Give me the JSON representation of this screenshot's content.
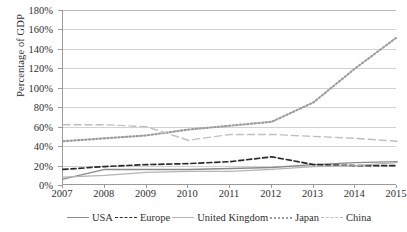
{
  "chart_data": {
    "type": "line",
    "title": "",
    "xlabel": "",
    "ylabel": "Percentage of GDP",
    "ylim": [
      0,
      180
    ],
    "ytick_step": 20,
    "grid": true,
    "legend_position": "bottom",
    "categories": [
      "2007",
      "2008",
      "2009",
      "2010",
      "2011",
      "2012",
      "2013",
      "2014",
      "2015"
    ],
    "x": [
      2007,
      2008,
      2009,
      2010,
      2011,
      2012,
      2013,
      2014,
      2015
    ],
    "ytick_labels": [
      "0%",
      "20%",
      "40%",
      "60%",
      "80%",
      "100%",
      "120%",
      "140%",
      "160%",
      "180%"
    ],
    "ytick_values": [
      0,
      20,
      40,
      60,
      80,
      100,
      120,
      140,
      160,
      180
    ],
    "series": [
      {
        "name": "USA",
        "values": [
          6,
          16,
          16,
          16,
          17,
          18,
          21,
          23,
          24
        ],
        "color": "#8a8a8a",
        "dash": "none",
        "width": 1.4
      },
      {
        "name": "Europe",
        "values": [
          16,
          19,
          21,
          22,
          24,
          29,
          21,
          20,
          20
        ],
        "color": "#2a2a2a",
        "dash": "5,3",
        "width": 1.7
      },
      {
        "name": "United Kingdom",
        "values": [
          8,
          10,
          13,
          14,
          14,
          16,
          19,
          20,
          23
        ],
        "color": "#b4b4b4",
        "dash": "none",
        "width": 1.3
      },
      {
        "name": "Japan",
        "values": [
          45,
          48,
          51,
          57,
          61,
          65,
          85,
          120,
          152
        ],
        "color": "#9c9c9c",
        "dash": "1.5,2.2",
        "width": 2.1
      },
      {
        "name": "China",
        "values": [
          62,
          62,
          60,
          46,
          52,
          52,
          50,
          48,
          45
        ],
        "color": "#bfbfbf",
        "dash": "7,4",
        "width": 1.4
      }
    ]
  },
  "axis": {
    "y_title": "Percentage of GDP"
  },
  "legend": {
    "items": [
      {
        "label": "USA",
        "swatch": "solid-line-icon"
      },
      {
        "label": "Europe",
        "swatch": "dashed-line-icon"
      },
      {
        "label": "United Kingdom",
        "swatch": "solid-line-icon"
      },
      {
        "label": "Japan",
        "swatch": "dotted-line-icon"
      },
      {
        "label": "China",
        "swatch": "long-dashed-line-icon"
      }
    ]
  },
  "colors": {
    "grid": "#d2d2d2",
    "axis": "#9a9a9a",
    "text": "#2f2f2f",
    "background": "#ffffff"
  }
}
